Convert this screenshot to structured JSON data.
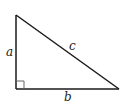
{
  "diagram": {
    "type": "right-triangle",
    "stroke_color": "#1a1a1a",
    "right_angle_marker_color": "#666666",
    "vertices": {
      "top": [
        16,
        15
      ],
      "bottom_left": [
        16,
        89
      ],
      "bottom_right": [
        119,
        89
      ]
    },
    "labels": {
      "a": "a",
      "b": "b",
      "c": "c"
    }
  }
}
